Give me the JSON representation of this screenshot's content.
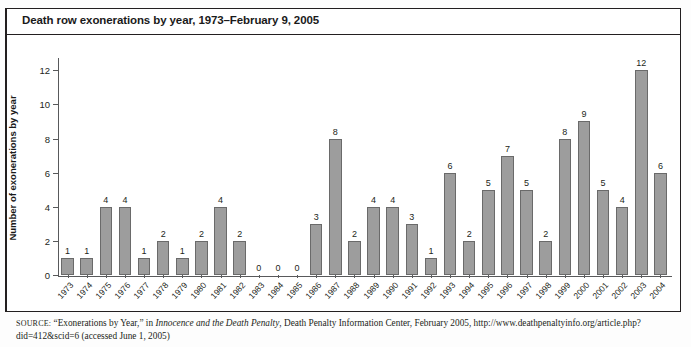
{
  "figure": {
    "title": "Death row exonerations by year, 1973–February 9, 2005"
  },
  "source": {
    "label": "SOURCE:",
    "text_before_italic": " “Exonerations by Year,” in ",
    "italic_title": "Innocence and the Death Penalty",
    "text_after_italic": ", Death Penalty Information Center, February 2005, http://www.deathpenaltyinfo.org/article.php?did=412&scid=6 (accessed June 1, 2005)"
  },
  "chart_data": {
    "type": "bar",
    "title": "Death row exonerations by year, 1973–February 9, 2005",
    "xlabel": "",
    "ylabel": "Number of exonerations by year",
    "ylim": [
      0,
      12.6
    ],
    "yticks": [
      0,
      2,
      4,
      6,
      8,
      10,
      12
    ],
    "ytick_labels": [
      "0",
      "2",
      "4",
      "6",
      "8",
      "10",
      "12"
    ],
    "grid": false,
    "legend": "none",
    "bar_color": "#9d9d9d",
    "bar_edge_color": "#6a6a6a",
    "show_value_labels": true,
    "categories": [
      "1973",
      "1974",
      "1975",
      "1976",
      "1977",
      "1978",
      "1979",
      "1980",
      "1981",
      "1982",
      "1983",
      "1984",
      "1985",
      "1986",
      "1987",
      "1988",
      "1989",
      "1990",
      "1991",
      "1992",
      "1993",
      "1994",
      "1995",
      "1996",
      "1997",
      "1998",
      "1999",
      "2000",
      "2001",
      "2002",
      "2003",
      "2004"
    ],
    "values": [
      1,
      1,
      4,
      4,
      1,
      2,
      1,
      2,
      4,
      2,
      0,
      0,
      0,
      3,
      8,
      2,
      4,
      4,
      3,
      1,
      6,
      2,
      5,
      7,
      5,
      2,
      8,
      9,
      5,
      4,
      12,
      6
    ],
    "value_labels": [
      "1",
      "1",
      "4",
      "4",
      "1",
      "2",
      "1",
      "2",
      "4",
      "2",
      "0",
      "0",
      "0",
      "3",
      "8",
      "2",
      "4",
      "4",
      "3",
      "1",
      "6",
      "2",
      "5",
      "7",
      "5",
      "2",
      "8",
      "9",
      "5",
      "4",
      "12",
      "6"
    ]
  }
}
